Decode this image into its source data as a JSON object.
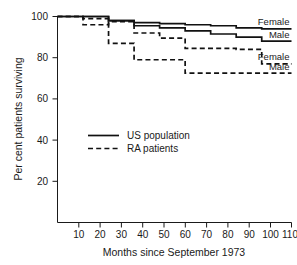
{
  "chart_data": {
    "type": "line",
    "title": "",
    "xlabel": "Months since September 1973",
    "ylabel": "Per cent patients surviving",
    "xlim": [
      0,
      110
    ],
    "ylim": [
      0,
      100
    ],
    "grid": false,
    "xticks": [
      10,
      20,
      30,
      40,
      50,
      60,
      70,
      80,
      90,
      100,
      110
    ],
    "xtick_labels": [
      "10",
      "20",
      "30",
      "40",
      "50",
      "60",
      "70",
      "80",
      "90",
      "100",
      "110"
    ],
    "yticks": [
      20,
      40,
      60,
      80,
      100
    ],
    "ytick_labels": [
      "20",
      "40",
      "60",
      "80",
      "100"
    ],
    "legend": {
      "position": "center-left",
      "entries": [
        {
          "label": "US population",
          "style": "solid"
        },
        {
          "label": "RA patients",
          "style": "dashed"
        }
      ]
    },
    "series": [
      {
        "name": "US population Female",
        "group": "US population",
        "sex": "Female",
        "style": "solid",
        "end_label": "Female",
        "x": [
          0,
          24,
          24,
          36,
          36,
          48,
          48,
          60,
          60,
          72,
          72,
          84,
          84,
          96,
          96,
          110
        ],
        "y": [
          100,
          100,
          98,
          98,
          97,
          97,
          96.5,
          96.5,
          96,
          96,
          95.5,
          95.5,
          94.5,
          94.5,
          94,
          94
        ]
      },
      {
        "name": "US population Male",
        "group": "US population",
        "sex": "Male",
        "style": "solid",
        "end_label": "Male",
        "x": [
          0,
          24,
          24,
          36,
          36,
          48,
          48,
          60,
          60,
          72,
          72,
          84,
          84,
          96,
          96,
          110
        ],
        "y": [
          100,
          100,
          98,
          98,
          95.5,
          95.5,
          94.5,
          94.5,
          93,
          93,
          91.5,
          91.5,
          90,
          90,
          88,
          88
        ]
      },
      {
        "name": "RA patients Female",
        "group": "RA patients",
        "sex": "Female",
        "style": "dashed",
        "end_label": "Female",
        "x": [
          0,
          12,
          12,
          24,
          24,
          36,
          36,
          48,
          48,
          60,
          60,
          84,
          84,
          96,
          96,
          110
        ],
        "y": [
          100,
          100,
          96,
          96,
          97.5,
          97.5,
          92,
          92,
          89.5,
          89.5,
          84.5,
          84.5,
          84,
          84,
          77,
          77
        ]
      },
      {
        "name": "RA patients Male",
        "group": "RA patients",
        "sex": "Male",
        "style": "dashed",
        "end_label": "Male",
        "x": [
          0,
          12,
          12,
          24,
          24,
          36,
          36,
          60,
          60,
          110
        ],
        "y": [
          100,
          100,
          99,
          99,
          87,
          87,
          79,
          79,
          72.5,
          72.5
        ]
      }
    ],
    "curve_end_labels": [
      {
        "text": "Female",
        "series": "US population Female"
      },
      {
        "text": "Male",
        "series": "US population Male"
      },
      {
        "text": "Female",
        "series": "RA patients Female"
      },
      {
        "text": "Male",
        "series": "RA patients Male"
      }
    ]
  }
}
